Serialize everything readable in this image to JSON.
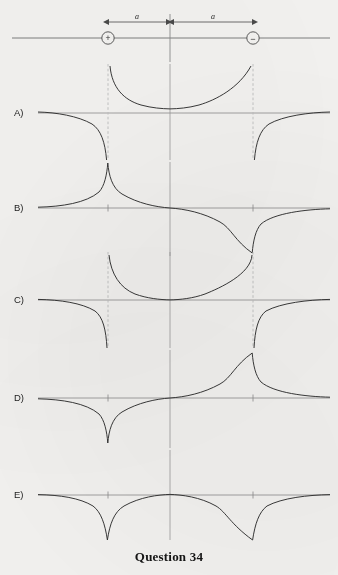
{
  "figure": {
    "caption": "Question 34",
    "background_color": "#f3f2f0",
    "line_color": "#4a4a4a",
    "curve_color": "#2e2e2e",
    "dashed_color": "#b3b3b3",
    "axis_color": "#8a8a8a",
    "label_color": "#1d1d1d"
  },
  "setup": {
    "name": "electric-dipole-axis",
    "positive_charge_symbol": "+",
    "negative_charge_symbol": "−",
    "positive_charge_x": 108,
    "negative_charge_x": 253,
    "center_x": 170,
    "axis_y": 38,
    "left_distance_label": "a",
    "right_distance_label": "a",
    "axis_start_x": 12,
    "axis_end_x": 330
  },
  "options": [
    {
      "id": "A",
      "label": "A)",
      "baseline_y": 113,
      "description": "Positive U-shaped branch between the charges rising to plus infinity at both charge positions; outside branches fall to minus infinity at the charges and approach zero far away.",
      "dashed_asymptotes": true,
      "inner_sign": "positive",
      "outer_sign": "negative"
    },
    {
      "id": "B",
      "label": "B)",
      "baseline_y": 208,
      "description": "Plus infinity spike at the positive charge, smooth decrease crossing zero at the centre, minus infinity spike at the negative charge; tends to zero at both far ends.",
      "dashed_asymptotes": false,
      "inner_sign": "crossing",
      "outer_sign": "decaying"
    },
    {
      "id": "C",
      "label": "C)",
      "baseline_y": 300,
      "description": "Positive U-shaped branch between the charges with a deeper minimum at the centre, rising to plus infinity at both charges; outer branches fall steeply to minus infinity.",
      "dashed_asymptotes": true,
      "inner_sign": "positive",
      "outer_sign": "negative"
    },
    {
      "id": "D",
      "label": "D)",
      "baseline_y": 398,
      "description": "Minus infinity spike at the positive charge, rising through zero at the centre to a plus infinity spike at the negative charge; tends to zero at both far ends.",
      "dashed_asymptotes": false,
      "inner_sign": "crossing-inverted",
      "outer_sign": "decaying"
    },
    {
      "id": "E",
      "label": "E)",
      "baseline_y": 495,
      "description": "Curve lies entirely below the axis, dipping to minus infinity at both charge positions and returning toward zero between and outside them.",
      "dashed_asymptotes": false,
      "inner_sign": "negative",
      "outer_sign": "negative"
    }
  ]
}
